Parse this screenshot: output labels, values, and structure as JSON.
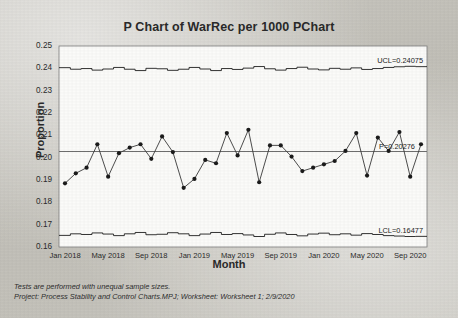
{
  "chart_data": {
    "type": "line",
    "title": "P Chart of WarRec per 1000 PChart",
    "xlabel": "Month",
    "ylabel": "Proportion",
    "ylim": [
      0.16,
      0.25
    ],
    "ytick_labels": [
      "0.25",
      "0.24",
      "0.23",
      "0.22",
      "0.21",
      "0.20",
      "0.19",
      "0.18",
      "0.17",
      "0.16"
    ],
    "ytick_values": [
      0.25,
      0.24,
      0.23,
      0.22,
      0.21,
      0.2,
      0.19,
      0.18,
      0.17,
      0.16
    ],
    "xtick_labels": [
      "Jan 2018",
      "May 2018",
      "Sep 2018",
      "Jan 2019",
      "May 2019",
      "Sep 2019",
      "Jan 2020",
      "May 2020",
      "Sep 2020"
    ],
    "xtick_indices": [
      0,
      4,
      8,
      12,
      16,
      20,
      24,
      28,
      32
    ],
    "grid": false,
    "legend": "none",
    "series": [
      {
        "name": "Proportion",
        "values": [
          0.1885,
          0.193,
          0.1955,
          0.206,
          0.1915,
          0.202,
          0.2045,
          0.206,
          0.1995,
          0.2095,
          0.2025,
          0.1865,
          0.1905,
          0.199,
          0.1975,
          0.211,
          0.201,
          0.2125,
          0.189,
          0.2055,
          0.2055,
          0.2005,
          0.194,
          0.1955,
          0.197,
          0.1985,
          0.203,
          0.211,
          0.192,
          0.209,
          0.203,
          0.2115,
          0.1915,
          0.206
        ]
      }
    ],
    "center_line": {
      "label": "P=0.20276",
      "value": 0.20276
    },
    "upper_control_limit": {
      "label": "UCL=0.24075",
      "value": 0.24075,
      "stepped": true,
      "values": [
        0.2403,
        0.2396,
        0.2399,
        0.2392,
        0.2397,
        0.2404,
        0.2396,
        0.239,
        0.24,
        0.2398,
        0.2391,
        0.2396,
        0.2404,
        0.2397,
        0.239,
        0.2399,
        0.2395,
        0.2401,
        0.2408,
        0.2398,
        0.2392,
        0.2399,
        0.2405,
        0.2397,
        0.2393,
        0.24,
        0.2396,
        0.2402,
        0.2395,
        0.2399,
        0.2404,
        0.2407,
        0.2409,
        0.24075
      ]
    },
    "lower_control_limit": {
      "label": "LCL=0.16477",
      "value": 0.16477,
      "stepped": true,
      "values": [
        0.1652,
        0.1659,
        0.1656,
        0.1663,
        0.1658,
        0.1651,
        0.1659,
        0.1665,
        0.1655,
        0.1657,
        0.1664,
        0.1659,
        0.1651,
        0.1658,
        0.1665,
        0.1656,
        0.166,
        0.1654,
        0.1647,
        0.1657,
        0.1663,
        0.1656,
        0.165,
        0.1658,
        0.1662,
        0.1655,
        0.1659,
        0.1653,
        0.166,
        0.1656,
        0.1651,
        0.1649,
        0.1647,
        0.16477
      ]
    },
    "footnotes": [
      "Tests are performed with unequal sample sizes.",
      "Project: Process Stability and Control Charts.MPJ; Worksheet: Worksheet 1; 2/9/2020"
    ]
  }
}
